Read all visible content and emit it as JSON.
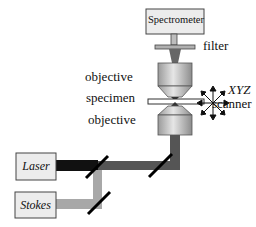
{
  "diagram": {
    "title": "",
    "components": {
      "spectrometer": {
        "label": "Spectrometer"
      },
      "filter": {
        "label": "filter"
      },
      "objective_top": {
        "label": "objective"
      },
      "specimen": {
        "label": "specimen"
      },
      "objective_bottom": {
        "label": "objective"
      },
      "scanner": {
        "label_line1": "XYZ",
        "label_line2": "scanner"
      },
      "laser": {
        "label": "Laser"
      },
      "stokes": {
        "label": "Stokes"
      }
    },
    "colors": {
      "laser_beam": "#111111",
      "stokes_beam": "#a8a8a8",
      "combined_beam": "#555555",
      "box_fill": "#ececec",
      "objective_fill": "#c4c4c4",
      "mirror": "#000000"
    }
  }
}
